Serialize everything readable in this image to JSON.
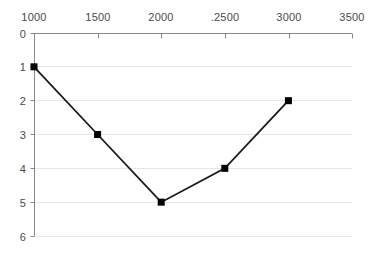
{
  "chart_data": {
    "type": "line",
    "title": "",
    "subtitle": "",
    "xlabel": "",
    "ylabel": "",
    "x": [
      1000,
      1500,
      2000,
      2500,
      3000
    ],
    "values": [
      1,
      3,
      5,
      4,
      2
    ],
    "series": [
      {
        "name": "",
        "x": [
          1000,
          1500,
          2000,
          2500,
          3000
        ],
        "values": [
          1,
          3,
          5,
          4,
          2
        ]
      }
    ],
    "xlim": [
      1000,
      3500
    ],
    "ylim": [
      0,
      6
    ],
    "y_axis_inverted": true,
    "x_axis_position": "top",
    "xticks": [
      1000,
      1500,
      2000,
      2500,
      3000,
      3500
    ],
    "xtick_labels": [
      "1000",
      "1500",
      "2000",
      ".2500",
      "3000",
      "3500"
    ],
    "yticks": [
      0,
      1,
      2,
      3,
      4,
      5,
      6
    ],
    "ytick_labels": [
      "0",
      "1",
      "2",
      "3",
      "4",
      "5",
      "6"
    ],
    "grid": true,
    "grid_axis": "y",
    "legend": false,
    "legend_position": "none",
    "marker": "square",
    "annotations": []
  },
  "style": {
    "background_color": "#ffffff",
    "line_color": "#1a1a1a",
    "marker_color": "#000000",
    "axis_color": "#888888",
    "grid_color": "#e6e6e6",
    "tick_text_color": "#4a4a4a"
  },
  "geometry": {
    "x_pixels": [
      34,
      98,
      161,
      225,
      289,
      352
    ],
    "y_pixels": [
      33,
      66,
      100,
      134,
      168,
      202,
      236
    ]
  }
}
